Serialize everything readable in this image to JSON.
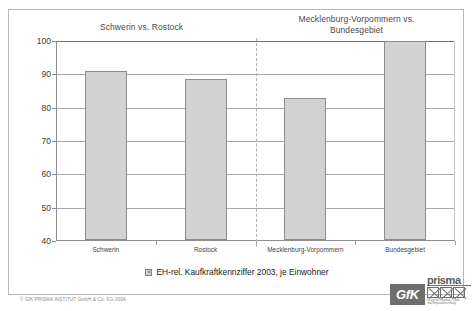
{
  "chart_data": {
    "type": "bar",
    "title": "",
    "categories": [
      "Schwerin",
      "Rostock",
      "Mecklenburg-Vorpommern",
      "Bundesgebiet"
    ],
    "values": [
      91,
      88.5,
      83,
      100
    ],
    "series": [
      {
        "name": "EH-rel. Kaufkraftkennziffer 2003, je Einwohner",
        "values": [
          91,
          88.5,
          83,
          100
        ]
      }
    ],
    "xlabel": "",
    "ylabel": "",
    "ylim": [
      40,
      100
    ],
    "yticks": [
      40,
      50,
      60,
      70,
      80,
      90,
      100
    ],
    "ytick_labels": [
      "40",
      "50",
      "60",
      "70",
      "80",
      "90",
      "100"
    ],
    "grid": true,
    "legend_position": "bottom",
    "legend_entries": [
      "EH-rel. Kaufkraftkennziffer 2003, je Einwohner"
    ],
    "annotations": [
      "Schwerin vs. Rostock",
      "Mecklenburg-Vorpommern vs. Bundesgebiet"
    ],
    "bar_color": "#d2d2d2",
    "bar_border_color": "#8d8d8d"
  },
  "groups": {
    "left": {
      "label": "Schwerin vs. Rostock"
    },
    "right": {
      "label": "Mecklenburg-Vorpommern vs.\nBundesgebiet"
    }
  },
  "legend": {
    "label": "EH-rel. Kaufkraftkennziffer 2003, je Einwohner"
  },
  "footer": {
    "copyright": "© GfK PRISMA INSTITUT GmbH & Co. KG 2004"
  },
  "logo": {
    "gfk": "GfK",
    "prisma": "prisma",
    "tagline": "Institut für Handels-, Stadt-\nund Regionalforschung"
  }
}
